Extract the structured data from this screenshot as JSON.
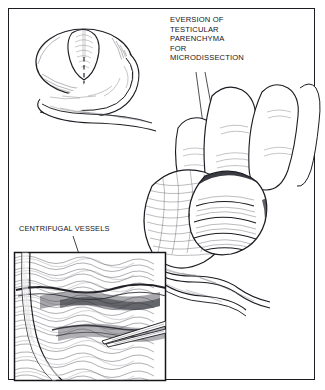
{
  "figure": {
    "domain": "medical-illustration",
    "background_color": "#ffffff",
    "ink_color": "#15151a",
    "frame": {
      "border_color": "#1c1c22",
      "border_width_px": 1.6
    }
  },
  "labels": {
    "eversion": {
      "name": "eversion-of-testicular-parenchyma-label",
      "lines": [
        "EVERSION OF",
        "TESTICULAR",
        "PARENCHYMA",
        "FOR",
        "MICRODISSECTION"
      ],
      "text": "EVERSION OF\nTESTICULAR\nPARENCHYMA\nFOR\nMICRODISSECTION",
      "align": "left",
      "leader_lines": 2
    },
    "centrifugal": {
      "name": "centrifugal-vessels-label",
      "lines": [
        "CENTRIFUGAL VESSELS"
      ],
      "text": "CENTRIFUGAL VESSELS",
      "align": "left",
      "leader_lines": 1
    }
  },
  "panels": {
    "inset_top_left": {
      "name": "testis-incision-diagram",
      "description": "Testis with elliptical tunica albuginea incision, dashed midline and epididymis curving beneath",
      "has_dashed_midline": true,
      "has_epididymis": true
    },
    "main": {
      "name": "hand-everting-testis-illustration",
      "description": "Gloved fingers compressing testis so parenchyma everts through the tunica incision; spermatic cord and epididymis below",
      "finger_count": 2
    },
    "inset_bottom_left": {
      "name": "magnified-parenchyma-inset",
      "description": "Magnified field of seminiferous tubules with dark centrifugal vessel band and microforceps tips entering from the right",
      "border_color": "#15151a",
      "has_forceps": true
    }
  }
}
